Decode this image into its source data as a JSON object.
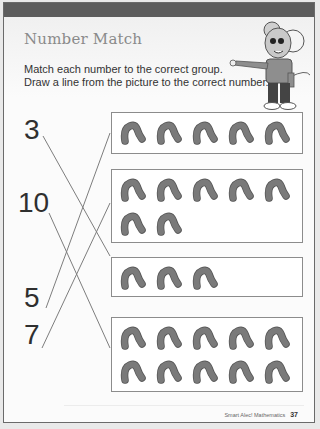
{
  "header": {
    "title": "Number Match",
    "instructions": [
      "Match each number to the correct group.",
      "Draw a line from the picture to the correct number."
    ],
    "mascot": "pointing-mouse-character"
  },
  "numbers": [
    {
      "label": "3",
      "matches_group": 3
    },
    {
      "label": "10",
      "matches_group": 4
    },
    {
      "label": "5",
      "matches_group": 1
    },
    {
      "label": "7",
      "matches_group": 2
    }
  ],
  "groups": [
    {
      "id": 1,
      "count": 5,
      "icon": "worm-icon"
    },
    {
      "id": 2,
      "count": 7,
      "icon": "worm-icon"
    },
    {
      "id": 3,
      "count": 3,
      "icon": "worm-icon"
    },
    {
      "id": 4,
      "count": 10,
      "icon": "worm-icon"
    }
  ],
  "footer": {
    "book": "Smart Alec! Mathematics",
    "page": "37"
  },
  "colors": {
    "topbar": "#5c5c5c",
    "title": "#8a8a8a",
    "worm": "#7a7a7a",
    "line": "#7d7d7d"
  }
}
